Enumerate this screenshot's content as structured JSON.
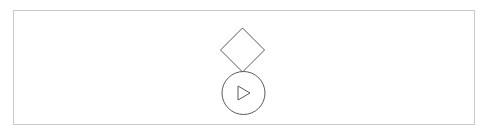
{
  "canvas": {
    "width": 489,
    "height": 135,
    "background_color": "#ffffff"
  },
  "panel": {
    "name": "diagram-frame",
    "x": 13,
    "y": 10,
    "width": 462,
    "height": 115,
    "border_color": "#c9c9c9",
    "border_width": 1,
    "fill_color": "#ffffff",
    "label": ""
  },
  "palette": {
    "stroke": "#5a5a5a",
    "frame_border": "#c9c9c9",
    "background": "#ffffff",
    "fill": "none"
  },
  "diagram": {
    "type": "flowchart",
    "orientation": "vertical",
    "node_count": 2,
    "nodes": [
      {
        "id": "decision-node",
        "name": "decision-diamond",
        "shape": "diamond",
        "label": "",
        "center_x": 242.5,
        "center_y": 50,
        "half_width": 22,
        "half_height": 22,
        "stroke_color": "#5a5a5a",
        "stroke_width": 1,
        "fill": "none"
      },
      {
        "id": "play-node",
        "name": "play-circle",
        "shape": "circle",
        "label": "",
        "center_x": 243.5,
        "center_y": 93,
        "radius": 21.5,
        "stroke_color": "#5a5a5a",
        "stroke_width": 1,
        "fill": "none",
        "glyph": {
          "name": "play-triangle-icon",
          "shape": "triangle",
          "direction": "right",
          "filled": false,
          "points": "238,86 250,93 238,100",
          "stroke_color": "#5a5a5a",
          "stroke_width": 1
        }
      }
    ],
    "connections": [
      {
        "id": "decision-to-play",
        "name": "diamond-to-circle-junction",
        "from": "decision-node",
        "to": "play-node",
        "style": "tangent",
        "visible_line": false
      }
    ]
  }
}
